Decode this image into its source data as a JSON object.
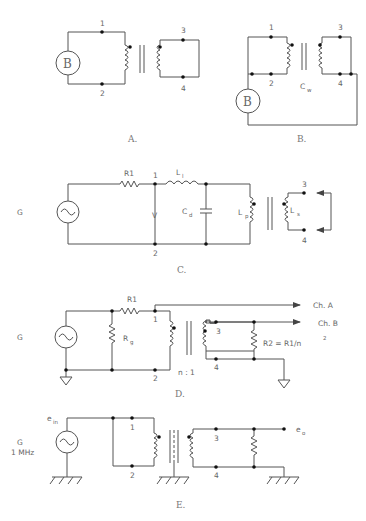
{
  "header": {
    "text": ""
  },
  "figures": {
    "A": {
      "caption": "A.",
      "source": "B",
      "nodes": [
        "1",
        "2",
        "3",
        "4"
      ]
    },
    "B": {
      "caption": "B.",
      "source": "B",
      "nodes": [
        "1",
        "2",
        "3",
        "4"
      ],
      "cap_label": "C",
      "cap_sub": "w"
    },
    "C": {
      "caption": "C.",
      "generator": "G",
      "resistor": "R1",
      "inductor_label": "L",
      "inductor_sub": "l",
      "voltage": "V",
      "cap_label": "C",
      "cap_sub": "d",
      "primary_label": "L",
      "primary_sub": "p",
      "secondary_label": "L",
      "secondary_sub": "s",
      "nodes": [
        "1",
        "2",
        "3",
        "4"
      ]
    },
    "D": {
      "caption": "D.",
      "generator": "G",
      "resistor": "R1",
      "rg_label": "R",
      "rg_sub": "g",
      "ratio": "n : 1",
      "r2_label": "R2 = R1/n",
      "r2_sup": "2",
      "ch_a": "Ch. A",
      "ch_b": "Ch. B",
      "nodes": [
        "1",
        "2",
        "3",
        "4"
      ]
    },
    "E": {
      "caption": "E.",
      "generator": "G",
      "frequency": "1 MHz",
      "ein_label": "e",
      "ein_sub": "in",
      "eo_label": "e",
      "eo_sub": "o",
      "nodes": [
        "1",
        "2",
        "3",
        "4"
      ]
    }
  }
}
